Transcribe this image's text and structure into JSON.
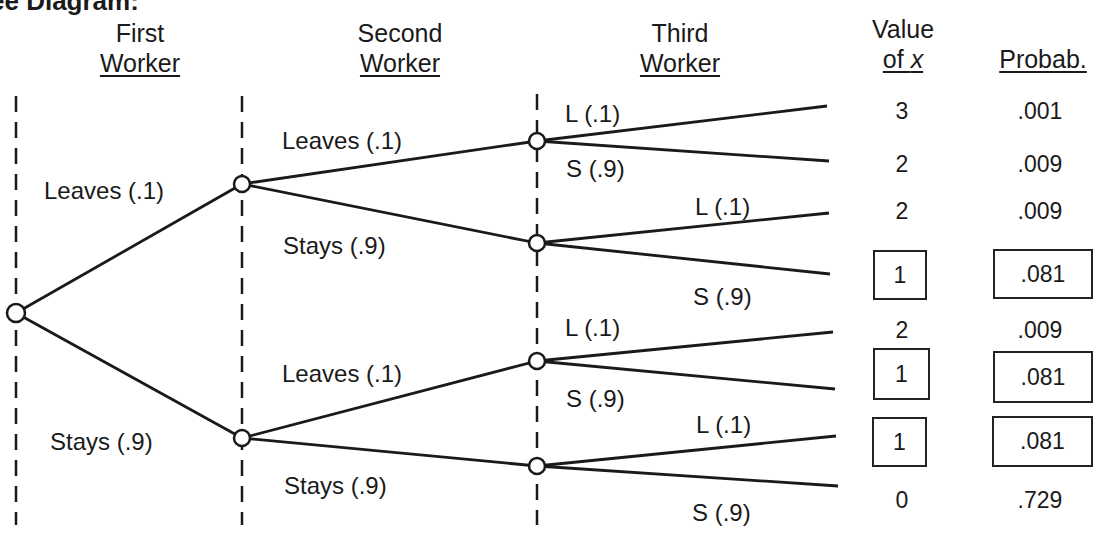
{
  "title": "ee Diagram:",
  "headers": {
    "first_worker": [
      "First",
      "Worker"
    ],
    "second_worker": [
      "Second",
      "Worker"
    ],
    "third_worker": [
      "Third",
      "Worker"
    ],
    "value_of_x": [
      "Value",
      "of x"
    ],
    "probability": "Probab."
  },
  "branches": {
    "first": {
      "leaves": "Leaves (.1)",
      "stays": "Stays (.9)"
    },
    "second_top": {
      "leaves": "Leaves (.1)",
      "stays": "Stays (.9)"
    },
    "second_bottom": {
      "leaves": "Leaves (.1)",
      "stays": "Stays (.9)"
    },
    "third": [
      {
        "l": "L (.1)",
        "s": "S (.9)"
      },
      {
        "l": "L (.1)",
        "s": "S (.9)"
      },
      {
        "l": "L (.1)",
        "s": "S (.9)"
      },
      {
        "l": "L (.1)",
        "s": "S (.9)"
      }
    ]
  },
  "outcomes": [
    {
      "x": "3",
      "p": ".001",
      "boxed": false
    },
    {
      "x": "2",
      "p": ".009",
      "boxed": false
    },
    {
      "x": "2",
      "p": ".009",
      "boxed": false
    },
    {
      "x": "1",
      "p": ".081",
      "boxed": true
    },
    {
      "x": "2",
      "p": ".009",
      "boxed": false
    },
    {
      "x": "1",
      "p": ".081",
      "boxed": true
    },
    {
      "x": "1",
      "p": ".081",
      "boxed": true
    },
    {
      "x": "0",
      "p": ".729",
      "boxed": false
    }
  ]
}
